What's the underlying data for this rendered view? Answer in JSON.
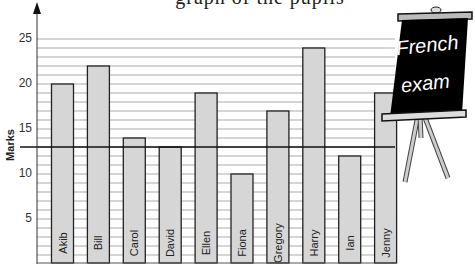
{
  "title_fragment": "graph of the pupils",
  "axes": {
    "ylabel": "Marks",
    "yticks": [
      "5",
      "10",
      "15",
      "20",
      "25"
    ]
  },
  "board": {
    "line1": "French",
    "line2": "exam"
  },
  "colors": {
    "bar_fill": "#d6d6d6",
    "bar_stroke": "#222222",
    "grid": "#888888",
    "board": "#000000"
  },
  "chart_data": {
    "type": "bar",
    "title": "",
    "xlabel": "",
    "ylabel": "Marks",
    "categories": [
      "Akib",
      "Bill",
      "Carol",
      "David",
      "Ellen",
      "Fiona",
      "Gregory",
      "Harry",
      "Ian",
      "Jenny"
    ],
    "values": [
      20,
      22,
      14,
      13,
      19,
      10,
      17,
      24,
      12,
      19
    ],
    "reference_line": {
      "value": 13,
      "style": "thick horizontal line"
    },
    "ylim": [
      0,
      25
    ],
    "yticks": [
      5,
      10,
      15,
      20,
      25
    ],
    "grid": "horizontal every 1 mark",
    "bar_label_position": "rotated inside bar",
    "annotation": "French exam"
  }
}
